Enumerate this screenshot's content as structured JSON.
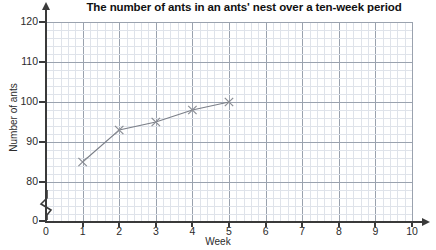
{
  "chart_data": {
    "type": "line",
    "title": "The number of ants in an ants' nest over a ten-week period",
    "xlabel": "Week",
    "ylabel": "Number of ants",
    "x": [
      1,
      2,
      3,
      4,
      5
    ],
    "values": [
      85,
      93,
      95,
      98,
      100
    ],
    "series": [
      {
        "name": "Number of ants",
        "x": [
          1,
          2,
          3,
          4,
          5
        ],
        "values": [
          85,
          93,
          95,
          98,
          100
        ]
      }
    ],
    "xlim": [
      0,
      10
    ],
    "ylim": [
      78,
      122
    ],
    "y_tick_labels": [
      "0",
      "80",
      "90",
      "100",
      "110",
      "120"
    ],
    "y_ticks": [
      0,
      80,
      90,
      100,
      110,
      120
    ],
    "x_tick_labels": [
      "0",
      "1",
      "2",
      "3",
      "4",
      "5",
      "6",
      "7",
      "8",
      "9",
      "10"
    ],
    "x_ticks": [
      0,
      1,
      2,
      3,
      4,
      5,
      6,
      7,
      8,
      9,
      10
    ],
    "grid": true,
    "minor_grid": true,
    "y_axis_break": true,
    "legend": null,
    "marker": "cross",
    "line_color": "#7b7f88",
    "marker_color": "#8a8d94",
    "grid_color": "#9aa2ae",
    "minor_grid_color": "#dfe3ea",
    "axis_color": "#3a3a3a",
    "origin_label": "0"
  }
}
